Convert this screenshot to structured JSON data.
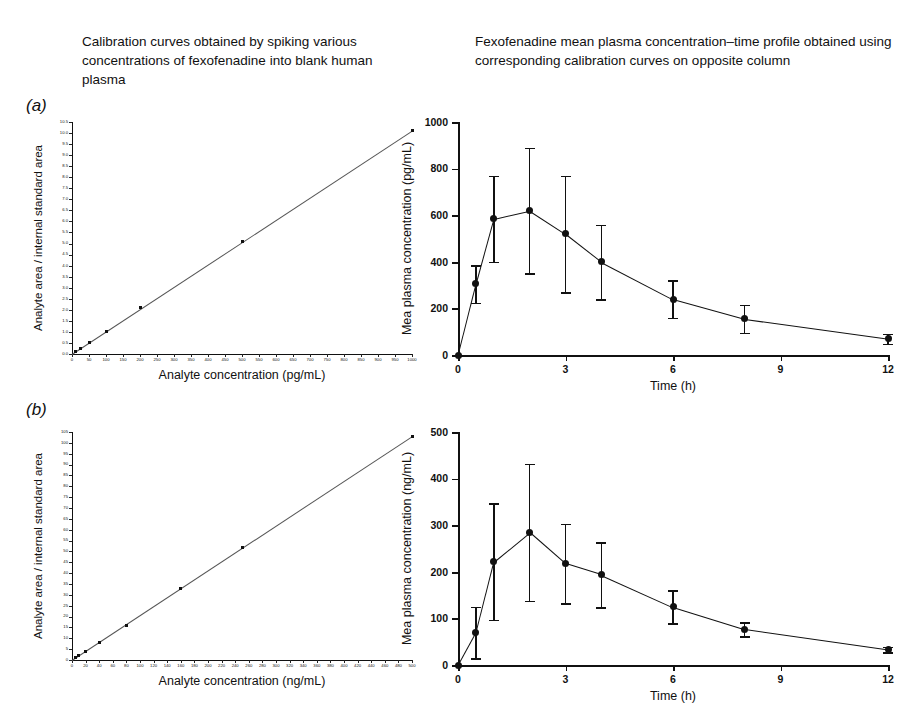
{
  "headings": {
    "left": "Calibration curves obtained by spiking various concentrations of fexofenadine into blank human plasma",
    "right": "Fexofenadine mean plasma concentration–time profile obtained using corresponding calibration curves on opposite column"
  },
  "panels": {
    "a_letter": "(a)",
    "b_letter": "(b)"
  },
  "chart_data": [
    {
      "id": "calibration-a",
      "panel": "(a)",
      "type": "scatter",
      "title": "Calibration curves obtained by spiking various concentrations of fexofenadine into blank human plasma",
      "xlabel": "Analyte concentration (pg/mL)",
      "ylabel": "Analyte area / internal standard area",
      "xlim": [
        0,
        1000
      ],
      "ylim": [
        0,
        10.5
      ],
      "grid": false,
      "legend": "none",
      "xticks": [
        0,
        50,
        100,
        150,
        200,
        250,
        300,
        350,
        400,
        450,
        500,
        550,
        600,
        650,
        700,
        750,
        800,
        850,
        900,
        950,
        1000
      ],
      "xticklabels": [
        "0",
        "50",
        "100",
        "150",
        "200",
        "250",
        "300",
        "350",
        "400",
        "450",
        "500",
        "550",
        "600",
        "650",
        "700",
        "750",
        "800",
        "850",
        "900",
        "950",
        "1000"
      ],
      "yticks": [
        0.0,
        0.5,
        1.0,
        1.5,
        2.0,
        2.5,
        3.0,
        3.5,
        4.0,
        4.5,
        5.0,
        5.5,
        6.0,
        6.5,
        7.0,
        7.5,
        8.0,
        8.5,
        9.0,
        9.5,
        10.0,
        10.5
      ],
      "yticklabels": [
        "0.0",
        "0.5",
        "1.0",
        "1.5",
        "2.0",
        "2.5",
        "3.0",
        "3.5",
        "4.0",
        "4.5",
        "5.0",
        "5.5",
        "6.0",
        "6.5",
        "7.0",
        "7.5",
        "8.0",
        "8.5",
        "9.0",
        "9.5",
        "10.0",
        "10.5"
      ],
      "x": [
        10,
        25,
        50,
        100,
        200,
        500,
        1000
      ],
      "y": [
        0.1,
        0.25,
        0.5,
        1.0,
        2.1,
        5.1,
        10.1
      ],
      "fit_line": {
        "intercept": 0.0,
        "slope": 0.0101
      }
    },
    {
      "id": "pk-a",
      "panel": "(a)",
      "type": "line",
      "title": "Fexofenadine mean plasma concentration–time profile obtained using corresponding calibration curves on opposite column",
      "xlabel": "Time (h)",
      "ylabel": "Mea plasma concentration (pg/mL)",
      "xlim": [
        0,
        12
      ],
      "ylim": [
        0,
        1000
      ],
      "grid": false,
      "legend": "none",
      "xticks": [
        0,
        3,
        6,
        9,
        12
      ],
      "xticklabels": [
        "0",
        "3",
        "6",
        "9",
        "12"
      ],
      "yticks": [
        0,
        200,
        400,
        600,
        800,
        1000
      ],
      "yticklabels": [
        "0",
        "200",
        "400",
        "600",
        "800",
        "1000"
      ],
      "x": [
        0,
        0.5,
        1,
        2,
        3,
        4,
        6,
        8,
        12
      ],
      "y": [
        0,
        305,
        585,
        620,
        520,
        400,
        240,
        155,
        70
      ],
      "yerr": [
        0,
        80,
        185,
        270,
        250,
        160,
        80,
        60,
        22
      ],
      "errorbars": true,
      "marker": "filled-circle"
    },
    {
      "id": "calibration-b",
      "panel": "(b)",
      "type": "scatter",
      "title": "Calibration curves obtained by spiking various concentrations of fexofenadine into blank human plasma",
      "xlabel": "Analyte concentration (ng/mL)",
      "ylabel": "Analyte area / internal standard area",
      "xlim": [
        0,
        500
      ],
      "ylim": [
        0,
        105
      ],
      "grid": false,
      "legend": "none",
      "xticks": [
        0,
        20,
        40,
        60,
        80,
        100,
        120,
        140,
        160,
        180,
        200,
        220,
        240,
        260,
        280,
        300,
        320,
        340,
        360,
        380,
        400,
        420,
        440,
        460,
        480,
        500
      ],
      "xticklabels": [
        "0",
        "20",
        "40",
        "60",
        "80",
        "100",
        "120",
        "140",
        "160",
        "180",
        "200",
        "220",
        "240",
        "260",
        "280",
        "300",
        "320",
        "340",
        "360",
        "380",
        "400",
        "420",
        "440",
        "460",
        "480",
        "500"
      ],
      "yticks": [
        0,
        5,
        10,
        15,
        20,
        25,
        30,
        35,
        40,
        45,
        50,
        55,
        60,
        65,
        70,
        75,
        80,
        85,
        90,
        95,
        100,
        105
      ],
      "yticklabels": [
        "0",
        "5",
        "10",
        "15",
        "20",
        "25",
        "30",
        "35",
        "40",
        "45",
        "50",
        "55",
        "60",
        "65",
        "70",
        "75",
        "80",
        "85",
        "90",
        "95",
        "100",
        "105"
      ],
      "x": [
        5,
        10,
        20,
        40,
        80,
        160,
        250,
        500
      ],
      "y": [
        1,
        2,
        4,
        8,
        16,
        33,
        52,
        103
      ],
      "fit_line": {
        "intercept": 0.0,
        "slope": 0.206
      }
    },
    {
      "id": "pk-b",
      "panel": "(b)",
      "type": "line",
      "title": "Fexofenadine mean plasma concentration–time profile obtained using corresponding calibration curves on opposite column",
      "xlabel": "Time (h)",
      "ylabel": "Mea plasma concentration (ng/mL)",
      "xlim": [
        0,
        12
      ],
      "ylim": [
        0,
        500
      ],
      "grid": false,
      "legend": "none",
      "xticks": [
        0,
        3,
        6,
        9,
        12
      ],
      "xticklabels": [
        "0",
        "3",
        "6",
        "9",
        "12"
      ],
      "yticks": [
        0,
        100,
        200,
        300,
        400,
        500
      ],
      "yticklabels": [
        "0",
        "100",
        "200",
        "300",
        "400",
        "500"
      ],
      "x": [
        0,
        0.5,
        1,
        2,
        3,
        4,
        6,
        8,
        12
      ],
      "y": [
        0,
        70,
        222,
        285,
        218,
        194,
        125,
        77,
        33
      ],
      "yerr": [
        0,
        55,
        125,
        147,
        85,
        70,
        35,
        15,
        6
      ],
      "errorbars": true,
      "marker": "filled-circle"
    }
  ]
}
